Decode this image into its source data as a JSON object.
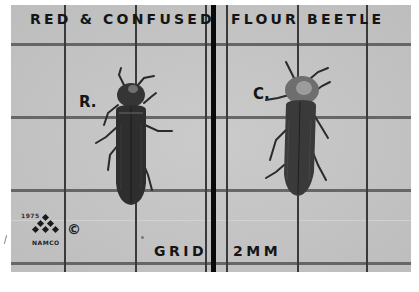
{
  "image": {
    "caption_left": "RED & CONFUSED",
    "caption_right": "FLOUR BEETLE",
    "grid_label_word": "GRID",
    "grid_label_size": "2MM",
    "specimens": [
      {
        "label": "R.",
        "name": "red flour beetle"
      },
      {
        "label": "C.",
        "name": "confused flour beetle"
      }
    ],
    "logo": {
      "year": "1975",
      "brand": "NAMCO",
      "copyright_symbol": "©"
    },
    "colors": {
      "paper": "#c4c4c4",
      "grid_line": "#5c5c5c",
      "center_bar": "#0a0a0a",
      "text": "#151515",
      "beetle_body": "#2e2e2e",
      "beetle_pronotum_c": "#7a7a7a"
    }
  }
}
